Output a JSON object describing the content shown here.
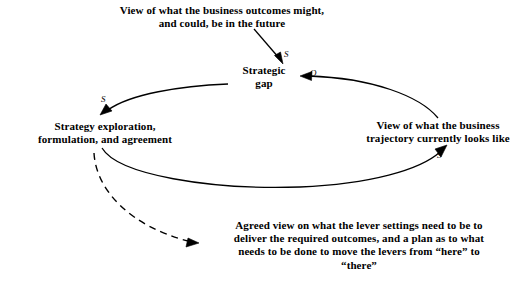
{
  "diagram": {
    "type": "causal-loop-diagram",
    "background_color": "#ffffff",
    "stroke_color": "#000000",
    "text_color": "#000000",
    "nodes": [
      {
        "id": "outcomes-view",
        "label": "View of what the business outcomes might,\nand could, be in the future"
      },
      {
        "id": "strategic-gap",
        "label": "Strategic\ngap"
      },
      {
        "id": "strategy-exploration",
        "label": "Strategy exploration,\nformulation, and agreement"
      },
      {
        "id": "trajectory-view",
        "label": "View of what the business\ntrajectory currently looks like"
      },
      {
        "id": "agreed-view",
        "label": "Agreed view on what the lever settings need to be to\ndeliver the required outcomes, and a plan as to what\nneeds to be done to move the levers from “here” to\n“there”"
      }
    ],
    "links": [
      {
        "id": "outcomes-to-gap",
        "from": "outcomes-view",
        "to": "strategic-gap",
        "style": "solid",
        "polarity": "S"
      },
      {
        "id": "trajectory-to-gap",
        "from": "trajectory-view",
        "to": "strategic-gap",
        "style": "solid",
        "polarity": "O"
      },
      {
        "id": "gap-to-strategy",
        "from": "strategic-gap",
        "to": "strategy-exploration",
        "style": "solid",
        "polarity": "S"
      },
      {
        "id": "strategy-to-trajectory",
        "from": "strategy-exploration",
        "to": "trajectory-view",
        "style": "solid",
        "polarity": "S"
      },
      {
        "id": "strategy-to-agreed",
        "from": "strategy-exploration",
        "to": "agreed-view",
        "style": "dashed",
        "polarity": ""
      }
    ],
    "polarity_labels": {
      "top": "S",
      "upper_right": "O",
      "upper_left": "S",
      "lower_right": "S"
    }
  }
}
